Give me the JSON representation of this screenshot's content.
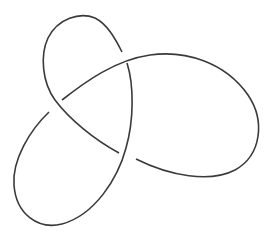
{
  "diagram": {
    "type": "knot-diagram",
    "name": "Trefoil knot",
    "crossings": 3,
    "stroke_color": "#3a3a3a",
    "background_color": "#ffffff",
    "strands": [
      {
        "id": "arc-1",
        "description": "top loop over left crossing, ending under upper crossing"
      },
      {
        "id": "arc-2",
        "description": "right lobe over upper crossing, over bottom crossing"
      },
      {
        "id": "arc-3",
        "description": "bottom-left loop under bottom crossing and left crossing"
      }
    ]
  }
}
